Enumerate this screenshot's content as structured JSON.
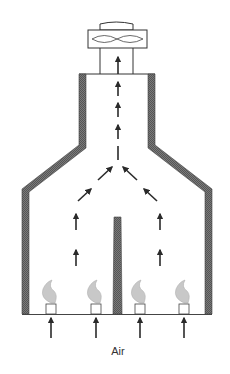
{
  "diagram": {
    "type": "schematic",
    "title": "",
    "labels": {
      "air": "Air"
    },
    "components": {
      "exhaust_fan": {
        "icon": "fan-icon"
      },
      "chimney": {
        "walls": "hatched"
      },
      "baffle": {
        "position": "center"
      },
      "burners": [
        {
          "id": 1,
          "icon": "flame-icon"
        },
        {
          "id": 2,
          "icon": "flame-icon"
        },
        {
          "id": 3,
          "icon": "flame-icon"
        },
        {
          "id": 4,
          "icon": "flame-icon"
        }
      ]
    },
    "colors": {
      "wall_fill": "#6f6f6f",
      "line": "#333333",
      "arrow": "#2a2a2a",
      "flame": "#b8b8b8",
      "background": "#ffffff"
    }
  }
}
